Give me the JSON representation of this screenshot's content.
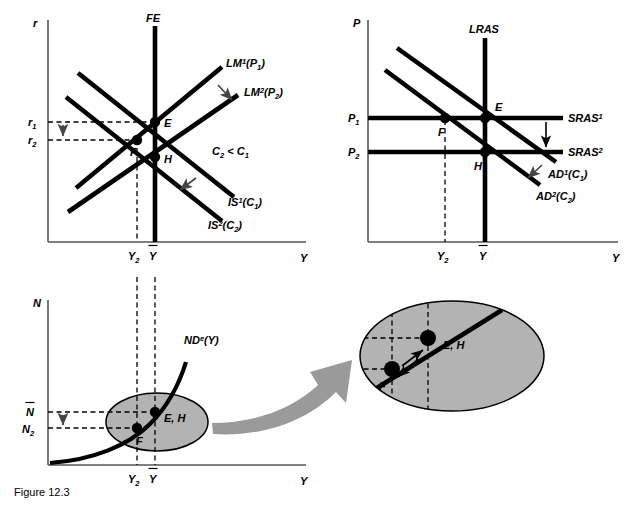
{
  "figure": {
    "caption": "Figure 12.3"
  },
  "panels": {
    "is_lm": {
      "name": "IS-LM / FE diagram",
      "y_axis_label": "r",
      "x_axis_label": "Y",
      "curves": [
        {
          "id": "FE",
          "label_main": "FE",
          "label_sup": "",
          "label_paren": ""
        },
        {
          "id": "LM1",
          "label_main": "LM",
          "label_sup": "1",
          "label_paren": "(P",
          "label_paren_sub": "1",
          "label_paren_close": ")"
        },
        {
          "id": "LM2",
          "label_main": "LM",
          "label_sup": "2",
          "label_paren": "(P",
          "label_paren_sub": "2",
          "label_paren_close": ")"
        },
        {
          "id": "IS1",
          "label_main": "IS",
          "label_sup": "1",
          "label_paren": "(C",
          "label_paren_sub": "1",
          "label_paren_close": ")"
        },
        {
          "id": "IS2",
          "label_main": "IS",
          "label_sup": "2",
          "label_paren": "(C",
          "label_paren_sub": "2",
          "label_paren_close": ")"
        }
      ],
      "points": [
        "E",
        "F",
        "H"
      ],
      "y_ticks": [
        {
          "main": "r",
          "sub": "1"
        },
        {
          "main": "r",
          "sub": "2"
        }
      ],
      "x_ticks": [
        {
          "main": "Y",
          "sub": "2"
        },
        {
          "main": "Y",
          "bar": true
        }
      ],
      "annotation": {
        "main": "C",
        "sub": "2",
        "op": " < ",
        "main2": "C",
        "sub2": "1"
      }
    },
    "ad_as": {
      "name": "AD-AS diagram",
      "y_axis_label": "P",
      "x_axis_label": "Y",
      "curves": [
        {
          "id": "LRAS",
          "label_main": "LRAS",
          "label_sup": ""
        },
        {
          "id": "SRAS1",
          "label_main": "SRAS",
          "label_sup": "1"
        },
        {
          "id": "SRAS2",
          "label_main": "SRAS",
          "label_sup": "2"
        },
        {
          "id": "AD1",
          "label_main": "AD",
          "label_sup": "1",
          "label_paren": "(C",
          "label_paren_sub": "1",
          "label_paren_close": ")"
        },
        {
          "id": "AD2",
          "label_main": "AD",
          "label_sup": "2",
          "label_paren": "(C",
          "label_paren_sub": "2",
          "label_paren_close": ")"
        }
      ],
      "points": [
        "E",
        "F",
        "H"
      ],
      "y_ticks": [
        {
          "main": "P",
          "sub": "1"
        },
        {
          "main": "P",
          "sub": "2"
        }
      ],
      "x_ticks": [
        {
          "main": "Y",
          "sub": "2"
        },
        {
          "main": "Y",
          "bar": true
        }
      ]
    },
    "labor": {
      "name": "Labor demand diagram",
      "y_axis_label": "N",
      "x_axis_label": "Y",
      "curves": [
        {
          "id": "NDe",
          "label_main": "ND",
          "label_sup": "e",
          "label_paren": "(Y)"
        }
      ],
      "points": [
        "F",
        "E, H"
      ],
      "y_ticks": [
        {
          "main": "N",
          "bar": true
        },
        {
          "main": "N",
          "sub": "2"
        }
      ],
      "x_ticks": [
        {
          "main": "Y",
          "sub": "2"
        },
        {
          "main": "Y",
          "bar": true
        }
      ]
    },
    "inset": {
      "name": "Magnified inset of labor diagram",
      "points": [
        "F",
        "E, H"
      ]
    }
  },
  "colors": {
    "line": "#000000",
    "axis": "#555555",
    "ellipse_fill": "#b3b3b3",
    "arrow_gray": "#9a9a9a",
    "background": "#ffffff"
  }
}
